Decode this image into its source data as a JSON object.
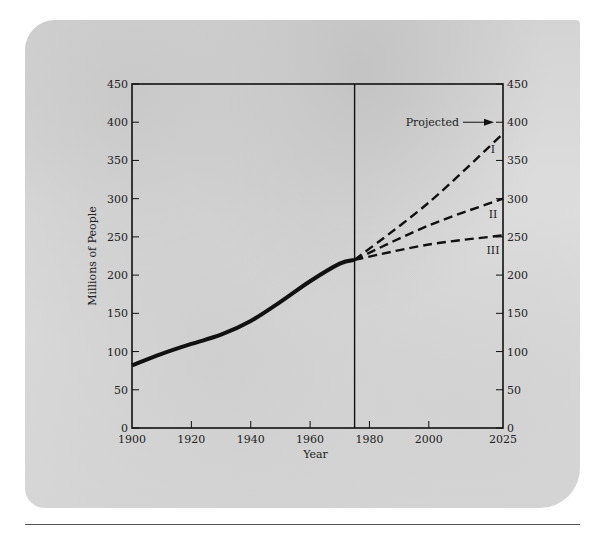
{
  "chart_data": {
    "type": "line",
    "title": "",
    "xlabel": "Year",
    "ylabel": "Millions of People",
    "xlim": [
      1900,
      2025
    ],
    "ylim": [
      0,
      450
    ],
    "x_ticks": [
      1900,
      1920,
      1940,
      1960,
      1980,
      2000,
      2025
    ],
    "y_ticks": [
      0,
      50,
      100,
      150,
      200,
      250,
      300,
      350,
      400,
      450
    ],
    "grid": false,
    "divider_year": 1975,
    "annotation": "Projected",
    "series": [
      {
        "name": "Historical",
        "style": "solid",
        "x": [
          1900,
          1910,
          1920,
          1930,
          1940,
          1950,
          1960,
          1970,
          1975
        ],
        "values": [
          82,
          97,
          110,
          122,
          140,
          165,
          192,
          215,
          220
        ]
      },
      {
        "name": "I",
        "style": "dashed",
        "x": [
          1975,
          2000,
          2025
        ],
        "values": [
          220,
          295,
          385
        ]
      },
      {
        "name": "II",
        "style": "dashed",
        "x": [
          1975,
          2000,
          2025
        ],
        "values": [
          220,
          265,
          300
        ]
      },
      {
        "name": "III",
        "style": "dashed",
        "x": [
          1975,
          2000,
          2025
        ],
        "values": [
          220,
          240,
          252
        ]
      }
    ]
  }
}
